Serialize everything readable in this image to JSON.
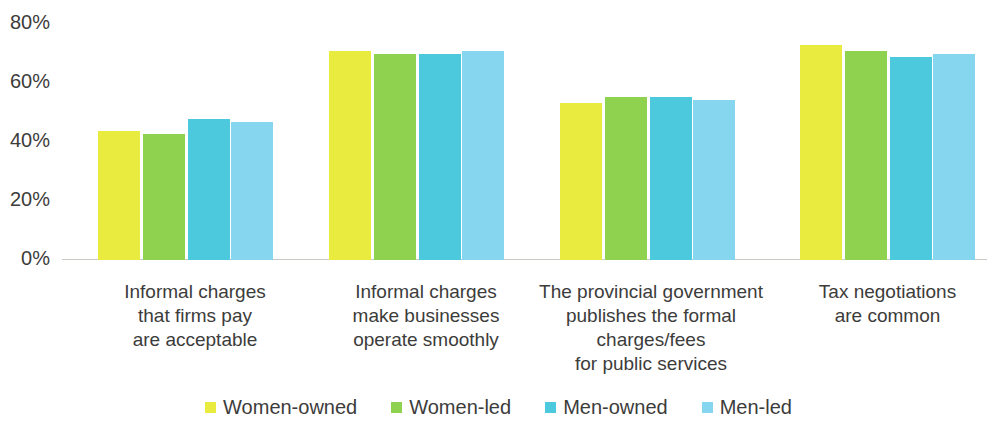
{
  "chart_data": {
    "type": "bar",
    "title": "",
    "subtitle": "",
    "xlabel": "",
    "ylabel": "",
    "ylim": [
      0,
      80
    ],
    "grid": false,
    "legend_position": "bottom",
    "y_ticks": [
      "0%",
      "20%",
      "40%",
      "60%",
      "80%"
    ],
    "y_tick_values": [
      0,
      20,
      40,
      60,
      80
    ],
    "categories": [
      "Informal charges\nthat firms pay\nare acceptable",
      "Informal charges\nmake businesses\noperate smoothly",
      "The provincial government\npublishes the formal\ncharges/fees\nfor public services",
      "Tax negotiations\nare common"
    ],
    "series": [
      {
        "name": "Women-owned",
        "color": "#e9ec3e",
        "values": [
          42,
          68,
          51,
          70
        ]
      },
      {
        "name": "Women-led",
        "color": "#8ed24f",
        "values": [
          41,
          67,
          53,
          68
        ]
      },
      {
        "name": "Men-owned",
        "color": "#4dc9de",
        "values": [
          46,
          67,
          53,
          66
        ]
      },
      {
        "name": "Men-led",
        "color": "#86d6ef",
        "values": [
          45,
          68,
          52,
          67
        ]
      }
    ]
  },
  "legend": {
    "items": [
      {
        "label": "Women-owned"
      },
      {
        "label": "Women-led"
      },
      {
        "label": "Men-owned"
      },
      {
        "label": "Men-led"
      }
    ]
  }
}
